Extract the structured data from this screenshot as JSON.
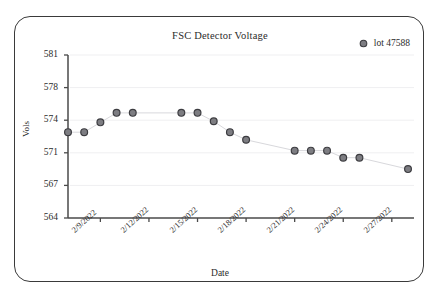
{
  "card": {
    "name": "chart-card"
  },
  "chart_data": {
    "type": "scatter",
    "title": "FSC Detector Voltage",
    "xlabel": "Date",
    "ylabel": "Vols",
    "grid": true,
    "legend_position": "top-right",
    "legend": [
      "lot 47588"
    ],
    "series": [
      {
        "name": "lot 47588",
        "marker": "circle",
        "color": "#5a5a5e",
        "x": [
          "2/7/2022",
          "2/8/2022",
          "2/9/2022",
          "2/10/2022",
          "2/11/2022",
          "2/14/2022",
          "2/15/2022",
          "2/16/2022",
          "2/17/2022",
          "2/18/2022",
          "2/21/2022",
          "2/22/2022",
          "2/23/2022",
          "2/24/2022",
          "2/25/2022",
          "2/28/2022"
        ],
        "values": [
          572.9,
          572.9,
          573.8,
          574.9,
          574.9,
          574.9,
          574.9,
          573.9,
          572.9,
          572.2,
          571.2,
          571.2,
          571.2,
          570.4,
          570.4,
          569.0
        ]
      }
    ],
    "yticks": [
      564,
      567,
      571,
      574,
      578,
      581
    ],
    "ylim": [
      564,
      581
    ],
    "xticks": [
      "2/9/2022",
      "2/12/2022",
      "2/15/2022",
      "2/18/2022",
      "2/21/2022",
      "2/24/2022",
      "2/27/2022"
    ]
  },
  "style": {
    "axis_color": "#4a4a4a",
    "grid_color": "#efeff1",
    "marker_fill": "#7d7d82",
    "marker_stroke": "#3c3c40",
    "line_color": "#d8d8dc",
    "text_color": "#2b2b2b"
  }
}
